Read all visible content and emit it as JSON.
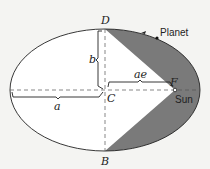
{
  "diagram": {
    "labels": {
      "top_point": "D",
      "bottom_point": "B",
      "center": "C",
      "focus": "F",
      "semi_major": "a",
      "semi_minor": "b",
      "focal_distance": "ae",
      "planet": "Planet",
      "sun": "Sun"
    },
    "colors": {
      "background": "#f4f4f2",
      "ellipse_fill": "#ffffff",
      "shaded_area": "#7a7a7a",
      "line": "#222222"
    },
    "geometry": {
      "center": [
        105,
        90
      ],
      "semi_major_px": 95,
      "semi_minor_px": 61,
      "focus": [
        175,
        90
      ]
    }
  }
}
